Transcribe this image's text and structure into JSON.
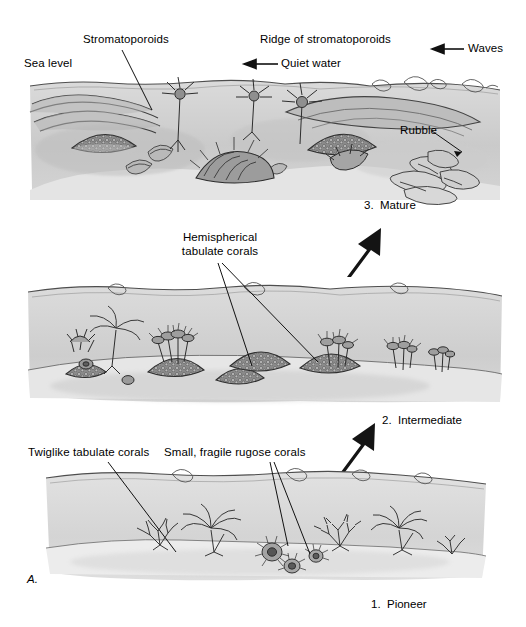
{
  "figure": {
    "letter": "A.",
    "title_implicit": "Stages of reef development",
    "panels": [
      {
        "id": "mature",
        "stage_label": "3.  Mature",
        "order": 3,
        "labels": [
          {
            "name": "sea-level",
            "text": "Sea level"
          },
          {
            "name": "stromatoporoids",
            "text": "Stromatoporoids"
          },
          {
            "name": "ridge-of-stromatoporoids",
            "text": "Ridge of stromatoporoids"
          },
          {
            "name": "quiet-water",
            "text": "Quiet water"
          },
          {
            "name": "waves",
            "text": "Waves"
          },
          {
            "name": "rubble",
            "text": "Rubble"
          }
        ]
      },
      {
        "id": "intermediate",
        "stage_label": "2.  Intermediate",
        "order": 2,
        "labels": [
          {
            "name": "hemispherical-tabulate-corals",
            "text_line1": "Hemispherical",
            "text_line2": "tabulate corals"
          }
        ]
      },
      {
        "id": "pioneer",
        "stage_label": "1.  Pioneer",
        "order": 1,
        "labels": [
          {
            "name": "twiglike-tabulate-corals",
            "text": "Twiglike tabulate corals"
          },
          {
            "name": "small-fragile-rugose-corals",
            "text": "Small, fragile rugose corals"
          }
        ]
      }
    ],
    "flow_arrows": [
      {
        "name": "arrow-pioneer-to-intermediate",
        "direction": "up-right"
      },
      {
        "name": "arrow-intermediate-to-mature",
        "direction": "up-right"
      }
    ],
    "colors": {
      "ink": "#1a1a1a",
      "water": "#c9c9c9",
      "water_light": "#dcdcdc",
      "seafloor": "#e8e8e8",
      "paper": "#ffffff",
      "arrow_black": "#111111"
    }
  }
}
